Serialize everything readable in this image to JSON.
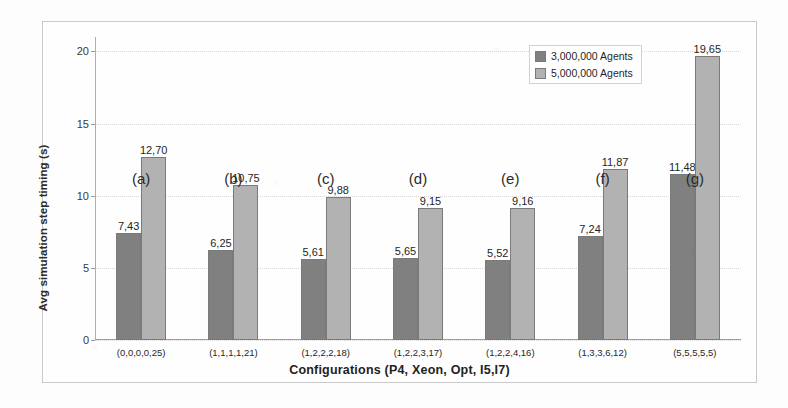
{
  "chart_data": {
    "type": "bar",
    "title": "",
    "xlabel": "Configurations (P4, Xeon, Opt, I5,I7)",
    "ylabel": "Avg simulation step timing (s)",
    "ylim": [
      0,
      21
    ],
    "yticks": [
      0,
      5,
      10,
      15,
      20
    ],
    "ytick_labels": [
      "0",
      "5",
      "10",
      "15",
      "20"
    ],
    "grid": true,
    "grid_axis": "y",
    "legend_position": "top-right",
    "decimal_separator": ",",
    "categories": [
      "(0,0,0,0,25)",
      "(1,1,1,1,21)",
      "(1,2,2,2,18)",
      "(1,2,2,3,17)",
      "(1,2,2,4,16)",
      "(1,3,3,6,12)",
      "(5,5,5,5,5)"
    ],
    "group_annotations": [
      "(a)",
      "(b)",
      "(c)",
      "(d)",
      "(e)",
      "(f)",
      "(g)"
    ],
    "series": [
      {
        "name": "3,000,000 Agents",
        "color": "#808080",
        "values": [
          7.43,
          6.25,
          5.61,
          5.65,
          5.52,
          7.24,
          11.48
        ],
        "labels": [
          "7,43",
          "6,25",
          "5,61",
          "5,65",
          "5,52",
          "7,24",
          "11,48"
        ]
      },
      {
        "name": "5,000,000 Agents",
        "color": "#b2b2b2",
        "values": [
          12.7,
          10.75,
          9.88,
          9.15,
          9.16,
          11.87,
          19.65
        ],
        "labels": [
          "12,70",
          "10,75",
          "9,88",
          "9,15",
          "9,16",
          "11,87",
          "19,65"
        ]
      }
    ]
  }
}
